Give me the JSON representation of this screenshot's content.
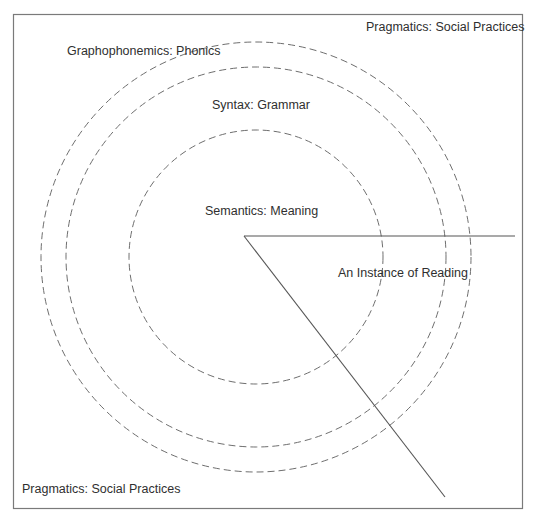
{
  "diagram": {
    "type": "concentric-cueing-systems",
    "frame": {
      "x": 13,
      "y": 14,
      "width": 510,
      "height": 495,
      "stroke": "#7a7a7a"
    },
    "center": {
      "x": 256,
      "y": 257
    },
    "circles": [
      {
        "name": "semantics",
        "r": 127,
        "stroke": "#6e6e6e",
        "dash": "7 4"
      },
      {
        "name": "syntax",
        "r": 190,
        "stroke": "#6e6e6e",
        "dash": "7 4"
      },
      {
        "name": "graphophonemics",
        "r": 215,
        "stroke": "#6e6e6e",
        "dash": "7 4"
      }
    ],
    "wedge": {
      "vertex": {
        "x": 244,
        "y": 236
      },
      "horizontal_end": {
        "x": 515,
        "y": 236
      },
      "diagonal_end": {
        "x": 445,
        "y": 497
      },
      "stroke": "#555555"
    },
    "labels": {
      "pragmatics_top": "Pragmatics: Social Practices",
      "graphophonemics": "Graphophonemics: Phonics",
      "syntax": "Syntax: Grammar",
      "semantics": "Semantics: Meaning",
      "instance": "An Instance of Reading",
      "pragmatics_bottom": "Pragmatics: Social Practices"
    }
  }
}
